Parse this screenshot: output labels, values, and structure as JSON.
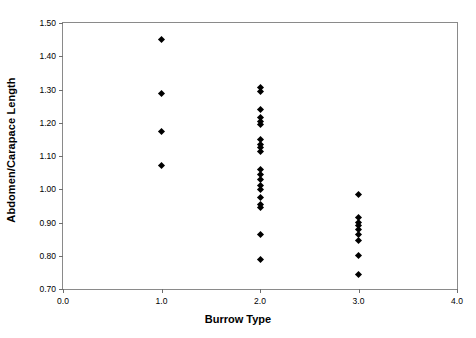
{
  "chart_data": {
    "type": "scatter",
    "title": "",
    "xlabel": "Burrow Type",
    "ylabel": "Abdomen/Carapace Length",
    "xlim": [
      0.0,
      4.0
    ],
    "ylim": [
      0.7,
      1.5
    ],
    "xticks": [
      "0.0",
      "1.0",
      "2.0",
      "3.0",
      "4.0"
    ],
    "xtick_values": [
      0.0,
      1.0,
      2.0,
      3.0,
      4.0
    ],
    "yticks": [
      "0.70",
      "0.80",
      "0.90",
      "1.00",
      "1.10",
      "1.20",
      "1.30",
      "1.40",
      "1.50"
    ],
    "ytick_values": [
      0.7,
      0.8,
      0.9,
      1.0,
      1.1,
      1.2,
      1.3,
      1.4,
      1.5
    ],
    "grid": false,
    "legend": false,
    "marker": "diamond",
    "marker_color": "#000000",
    "frame_color": "#8a8a8a",
    "series": [
      {
        "name": "Burrow Type 1",
        "x": 1.0,
        "values": [
          1.45,
          1.288,
          1.175,
          1.07
        ]
      },
      {
        "name": "Burrow Type 2",
        "x": 2.0,
        "values": [
          1.305,
          1.295,
          1.24,
          1.215,
          1.205,
          1.195,
          1.15,
          1.135,
          1.125,
          1.115,
          1.06,
          1.045,
          1.03,
          1.01,
          1.0,
          0.975,
          0.955,
          0.945,
          0.865,
          0.79
        ]
      },
      {
        "name": "Burrow Type 3",
        "x": 3.0,
        "values": [
          0.985,
          0.915,
          0.9,
          0.89,
          0.88,
          0.865,
          0.845,
          0.8,
          0.745
        ]
      }
    ]
  }
}
